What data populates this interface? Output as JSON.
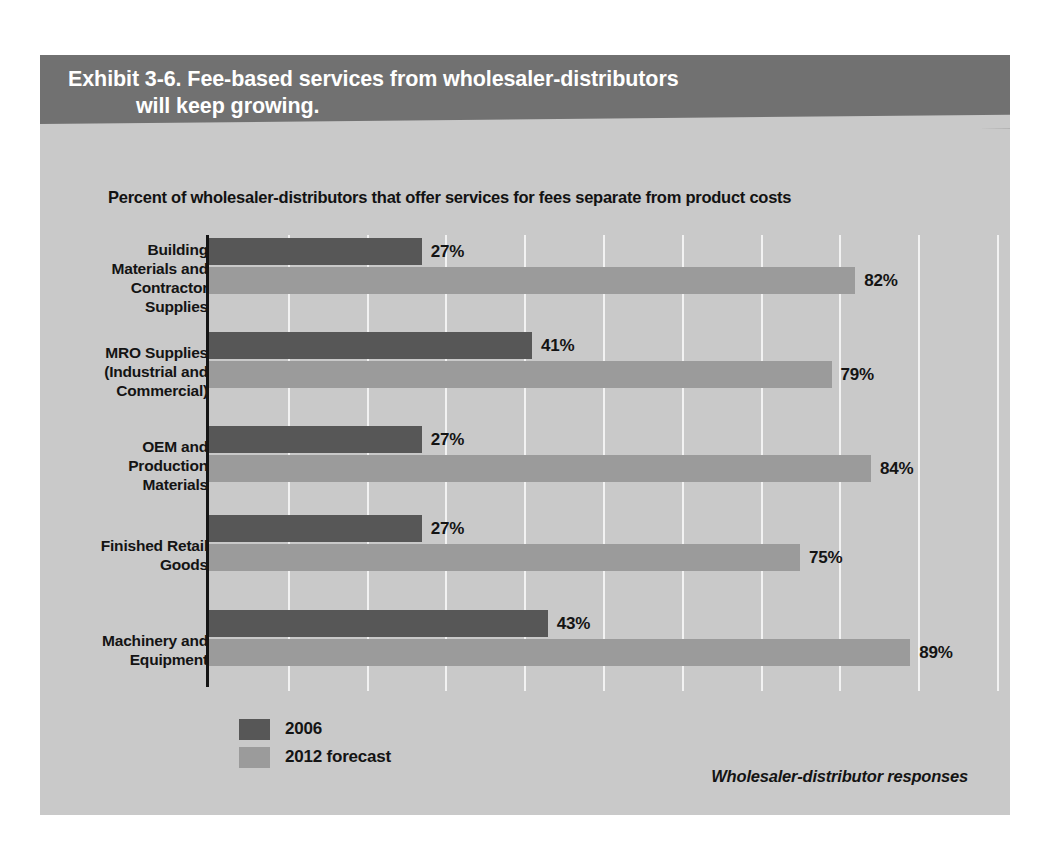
{
  "exhibit": {
    "title_line1": "Exhibit 3-6. Fee-based services from wholesaler-distributors",
    "title_line2": "will keep growing.",
    "subtitle": "Percent of wholesaler-distributors that offer services for fees separate from product costs",
    "source_note": "Wholesaler-distributor responses"
  },
  "colors": {
    "panel_background": "#c9c9c9",
    "header_band": "#717171",
    "series_2006": "#575757",
    "series_2012": "#9b9b9b",
    "gridline": "#f2f2f2",
    "axis": "#141414",
    "title_text": "#ffffff",
    "body_text": "#141414"
  },
  "legend": {
    "position": "bottom-left",
    "items": [
      {
        "label": "2006",
        "color": "#575757"
      },
      {
        "label": "2012 forecast",
        "color": "#9b9b9b"
      }
    ]
  },
  "chart_data": {
    "type": "bar",
    "orientation": "horizontal",
    "title": "Exhibit 3-6. Fee-based services from wholesaler-distributors will keep growing.",
    "subtitle": "Percent of wholesaler-distributors that offer services for fees separate from product costs",
    "xlabel": "",
    "ylabel": "",
    "xlim": [
      0,
      100
    ],
    "xticks": [
      0,
      10,
      20,
      30,
      40,
      50,
      60,
      70,
      80,
      90,
      100
    ],
    "xtick_labels": [],
    "grid": true,
    "grid_axis": "x",
    "legend_position": "bottom-left",
    "annotation": "Wholesaler-distributor responses",
    "categories": [
      "Building Materials and Contractor Supplies",
      "MRO Supplies (Industrial and Commercial)",
      "OEM and Production Materials",
      "Finished Retail Goods",
      "Machinery and Equipment"
    ],
    "series": [
      {
        "name": "2006",
        "color": "#575757",
        "values": [
          27,
          41,
          27,
          27,
          43
        ],
        "value_labels": [
          "27%",
          "41%",
          "27%",
          "27%",
          "43%"
        ]
      },
      {
        "name": "2012 forecast",
        "color": "#9b9b9b",
        "values": [
          82,
          79,
          84,
          75,
          89
        ],
        "value_labels": [
          "82%",
          "79%",
          "84%",
          "75%",
          "89%"
        ]
      }
    ]
  },
  "categories_display": [
    {
      "lines": [
        "Building",
        "Materials and",
        "Contractor",
        "Supplies"
      ]
    },
    {
      "lines": [
        "MRO Supplies",
        "(Industrial and",
        "Commercial)"
      ]
    },
    {
      "lines": [
        "OEM and",
        "Production",
        "Materials"
      ]
    },
    {
      "lines": [
        "Finished Retail",
        "Goods"
      ]
    },
    {
      "lines": [
        "Machinery and",
        "Equipment"
      ]
    }
  ]
}
